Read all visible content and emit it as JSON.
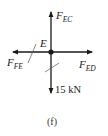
{
  "diagram": {
    "type": "free-body-diagram",
    "caption": "(f)",
    "node": {
      "label": "E",
      "x": 51,
      "y": 52
    },
    "forces": [
      {
        "id": "FEC",
        "symbol": "F",
        "subscript": "EC",
        "direction": "up",
        "tip": [
          51,
          12
        ]
      },
      {
        "id": "FED",
        "symbol": "F",
        "subscript": "ED",
        "direction": "right",
        "tip": [
          92,
          52
        ]
      },
      {
        "id": "FFE",
        "symbol": "F",
        "subscript": "FE",
        "direction": "left",
        "tip": [
          13,
          52
        ]
      },
      {
        "id": "load",
        "label": "15 kN",
        "direction": "down",
        "tip": [
          51,
          93
        ]
      }
    ],
    "labels": {
      "f_ec_main": "F",
      "f_ec_sub": "EC",
      "f_ed_main": "F",
      "f_ed_sub": "ED",
      "f_fe_main": "F",
      "f_fe_sub": "FE",
      "load": "15 kN",
      "node": "E",
      "caption": "(f)"
    },
    "colors": {
      "line": "#1a1a1a",
      "background": "#ffffff"
    }
  }
}
